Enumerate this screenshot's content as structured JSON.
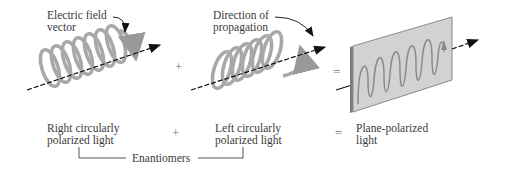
{
  "diagram": {
    "callouts": {
      "electric_field": [
        "Electric field",
        "vector"
      ],
      "direction": [
        "Direction of",
        "propagation"
      ]
    },
    "operators": {
      "plus_top": "+",
      "equals_top": "=",
      "plus_bottom": "+",
      "equals_bottom": "="
    },
    "captions": {
      "right": [
        "Right circularly",
        "polarized light"
      ],
      "left": [
        "Left circularly",
        "polarized light"
      ],
      "plane": [
        "Plane-polarized",
        "light"
      ]
    },
    "bracket_label": "Enantiomers",
    "colors": {
      "helix": "#a8a8a8",
      "panel_face": "#d2d2d2",
      "panel_edge": "#8a8a8a",
      "wave": "#8a8a8a",
      "arrow": "#111111",
      "text": "#3a3a3a"
    }
  }
}
